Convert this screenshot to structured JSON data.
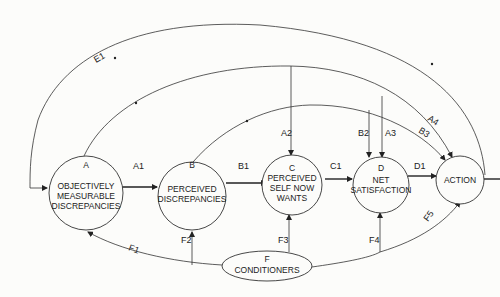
{
  "nodes": {
    "a": {
      "letter": "A",
      "line1": "OBJECTIVELY",
      "line2": "MEASURABLE",
      "line3": "DISCREPANCIES"
    },
    "b": {
      "letter": "B",
      "line1": "PERCEIVED",
      "line2": "DISCREPANCIES"
    },
    "c": {
      "letter": "C",
      "line1": "PERCEIVED",
      "line2": "SELF NOW",
      "line3": "WANTS"
    },
    "d": {
      "letter": "D",
      "line1": "NET",
      "line2": "SATISFACTION"
    },
    "action": {
      "label": "ACTION"
    },
    "f": {
      "letter": "F",
      "line1": "CONDITIONERS"
    }
  },
  "edges": {
    "a1": "A1",
    "b1": "B1",
    "c1": "C1",
    "d1": "D1",
    "a2": "A2",
    "a3": "A3",
    "a4": "A4",
    "b2": "B2",
    "b3": "B3",
    "e1": "E1",
    "f1": "F1",
    "f2": "F2",
    "f3": "F3",
    "f4": "F4",
    "f5": "F5"
  }
}
